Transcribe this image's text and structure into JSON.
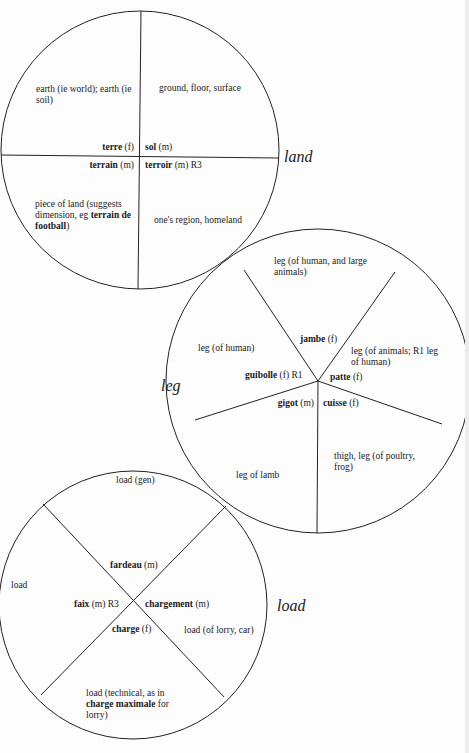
{
  "land": {
    "label": "land",
    "quadrants": [
      {
        "gloss": "earth (ie world); earth (ie soil)",
        "word": "terre",
        "gender": "(f)"
      },
      {
        "gloss": "ground, floor, surface",
        "word": "sol",
        "gender": "(m)"
      },
      {
        "gloss_pre": "piece of land (suggests dimension, eg ",
        "gloss_bold": "terrain de football",
        "gloss_post": ")",
        "word": "terrain",
        "gender": "(m)"
      },
      {
        "gloss": "one's region, homeland",
        "word": "terroir",
        "gender": "(m) R3"
      }
    ]
  },
  "leg": {
    "label": "leg",
    "segments": [
      {
        "gloss": "leg (of human, and large animals)",
        "word": "jambe",
        "gender": "(f)"
      },
      {
        "gloss": "leg (of animals; R1 leg of human)",
        "word": "patte",
        "gender": "(f)"
      },
      {
        "gloss": "thigh, leg (of poultry, frog)",
        "word": "cuisse",
        "gender": "(f)"
      },
      {
        "gloss": "leg of lamb",
        "word": "gigot",
        "gender": "(m)"
      },
      {
        "gloss": "leg (of human)",
        "word": "guibolle",
        "gender": "(f) R1"
      }
    ]
  },
  "load": {
    "label": "load",
    "segments": [
      {
        "gloss": "load (gen)",
        "word": "fardeau",
        "gender": "(m)"
      },
      {
        "gloss": "load (of lorry, car)",
        "word": "chargement",
        "gender": "(m)"
      },
      {
        "gloss_pre": "load (technical, as in ",
        "gloss_bold": "charge maximale",
        "gloss_post": " for lorry)",
        "word": "charge",
        "gender": "(f)"
      },
      {
        "gloss": "load",
        "word": "faix",
        "gender": "(m) R3"
      }
    ]
  }
}
